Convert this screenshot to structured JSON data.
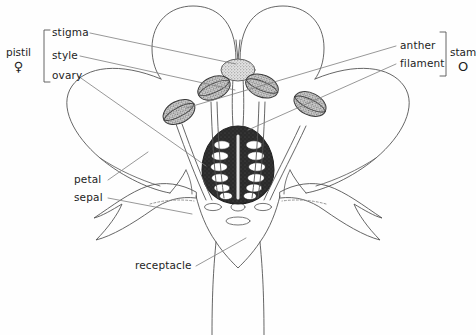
{
  "diagram": {
    "background_color": "#fefefe",
    "ink_color": "#3a3a3a",
    "label_color": "#1d1d1d",
    "ovary_fill_color": "#2b2b2b",
    "ovule_color": "#ffffff",
    "anther_fill_color": "#cfcfcf"
  },
  "groups": {
    "pistil": {
      "label": "pistil",
      "symbol": "♀"
    },
    "stamen": {
      "label": "stam",
      "symbol": "O"
    }
  },
  "labels": {
    "stigma": "stigma",
    "style": "style",
    "ovary": "ovary",
    "anther": "anther",
    "filament": "filament",
    "petal": "petal",
    "sepal": "sepal",
    "receptacle": "receptacle"
  },
  "structures": {
    "ovules_per_side": 6,
    "ovules_total": 12,
    "anther_count": 4,
    "upper_petal_count": 2,
    "side_petal_count": 2,
    "sepal_count": 2,
    "stigma_count": 1,
    "style_count": 1
  }
}
